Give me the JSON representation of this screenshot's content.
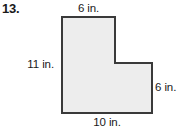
{
  "exercise": {
    "number": "13.",
    "figure_name": "l-shaped-polygon",
    "unit": "in.",
    "fill_color": "#ededed",
    "stroke_color": "#3a3a3a"
  },
  "labels": {
    "top": "6 in.",
    "left": "11 in.",
    "right": "6 in.",
    "bottom": "10 in."
  },
  "figure": {
    "points": "62,17 115,17 115,63 152,63 152,113 62,113",
    "dimensions": {
      "top_width": 6,
      "left_height": 11,
      "right_height": 6,
      "bottom_width": 10
    }
  }
}
